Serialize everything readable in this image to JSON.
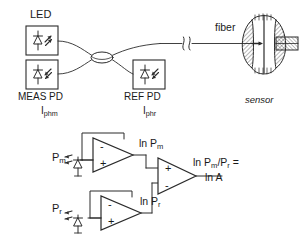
{
  "figure": {
    "optical_section": {
      "led_label": "LED",
      "meas_pd_label": "MEAS PD",
      "meas_pd_current": "I",
      "meas_pd_current_sub": "phm",
      "ref_pd_label": "REF PD",
      "ref_pd_current": "I",
      "ref_pd_current_sub": "phr",
      "fiber_label": "fiber",
      "sensor_label": "sensor",
      "coupler_name": "fiber-optic-coupler",
      "break_symbol": "fiber-break-squiggle"
    },
    "circuit_section": {
      "input_pm": "P",
      "input_pm_sub": "m",
      "input_pr": "P",
      "input_pr_sub": "r",
      "node_lnpm": "ln P",
      "node_lnpm_sub": "m",
      "node_lnpr": "ln P",
      "node_lnpr_sub": "r",
      "output_line1": "ln P",
      "output_line1_sub": "m",
      "output_line1_tail": "/P",
      "output_line1_sub2": "r",
      "output_line1_end": " =",
      "output_line2": "ln A",
      "opamp_top_signs": [
        "-",
        "+"
      ],
      "opamp_bottom_signs": [
        "-",
        "+"
      ],
      "opamp_diff_signs": [
        "+",
        "-"
      ]
    },
    "colors": {
      "ink": "#1a1a1a",
      "line": "#2b2b2b",
      "background": "#ffffff"
    }
  }
}
